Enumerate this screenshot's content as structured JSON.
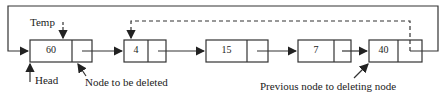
{
  "diagram": {
    "nodes": [
      {
        "value": "60"
      },
      {
        "value": "4"
      },
      {
        "value": "15"
      },
      {
        "value": "7"
      },
      {
        "value": "40"
      }
    ],
    "labels": {
      "temp": "Temp",
      "head": "Head",
      "node_to_delete": "Node to be deleted",
      "previous_node": "Previous node to deleting node"
    }
  }
}
